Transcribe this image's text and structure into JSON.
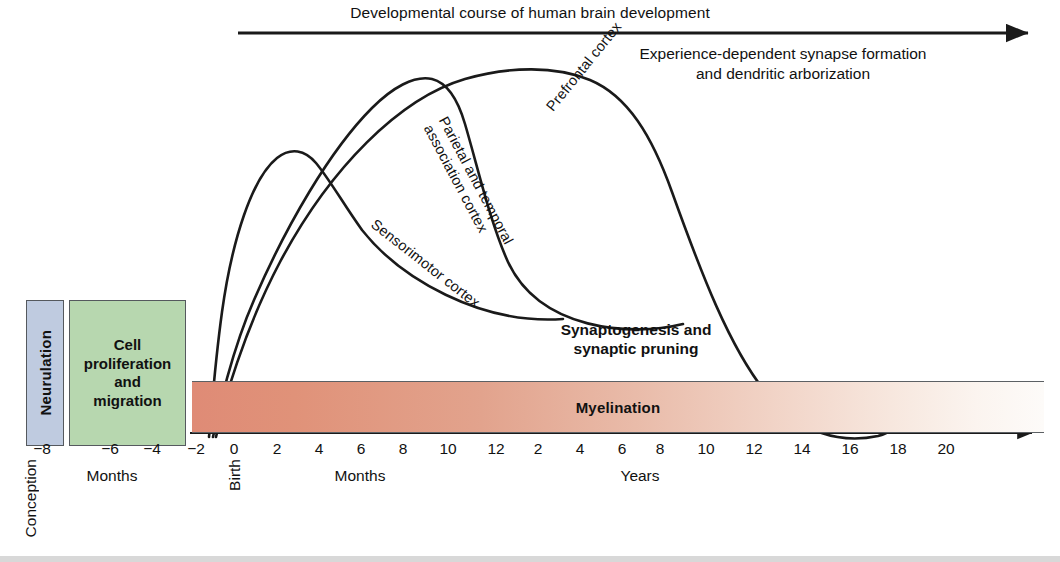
{
  "title": "Developmental course of human brain development",
  "annotations": {
    "experience_note_line1": "Experience-dependent synapse formation",
    "experience_note_line2": "and dendritic arborization",
    "synaptogenesis_line1": "Synaptogenesis and",
    "synaptogenesis_line2": "synaptic pruning",
    "myelination": "Myelination"
  },
  "phase_boxes": [
    {
      "id": "neurulation",
      "label": "Neurulation",
      "color": "#bfcbe0",
      "orientation": "vertical"
    },
    {
      "id": "cell-proliferation",
      "label": "Cell\nproliferation\nand\nmigration",
      "label_line1": "Cell",
      "label_line2": "proliferation",
      "label_line3": "and",
      "label_line4": "migration",
      "color": "#b7d7af",
      "orientation": "horizontal"
    }
  ],
  "axis": {
    "conception_label": "Conception",
    "birth_label": "Birth",
    "section1_name": "Months",
    "section2_name": "Months",
    "section3_name": "Years",
    "prenatal_ticks": [
      "−8",
      "−6",
      "−4",
      "−2"
    ],
    "infant_month_ticks": [
      "0",
      "2",
      "4",
      "6",
      "8",
      "10",
      "12"
    ],
    "year_ticks": [
      "2",
      "4",
      "6",
      "8",
      "10",
      "12",
      "14",
      "16",
      "18",
      "20"
    ]
  },
  "chart_data": {
    "type": "line",
    "title": "Developmental course of human brain development",
    "xlabel": "Age (months prenatal / months postnatal / years)",
    "ylabel": "Relative synaptic density",
    "grid": false,
    "legend": "inline-curve-labels",
    "xlim": [
      "-9 months",
      "21 years"
    ],
    "ylim": [
      0,
      1
    ],
    "series": [
      {
        "name": "Sensorimotor cortex",
        "label": "Sensorimotor cortex",
        "peak_age": "2-3 months",
        "points": [
          {
            "age": "-2 months",
            "value": 0.02
          },
          {
            "age": "-1 month",
            "value": 0.25
          },
          {
            "age": "0 months",
            "value": 0.62
          },
          {
            "age": "1 month",
            "value": 0.85
          },
          {
            "age": "2 months",
            "value": 0.93
          },
          {
            "age": "4 months",
            "value": 0.92
          },
          {
            "age": "6 months",
            "value": 0.84
          },
          {
            "age": "8 months",
            "value": 0.72
          },
          {
            "age": "10 months",
            "value": 0.6
          },
          {
            "age": "12 months",
            "value": 0.49
          },
          {
            "age": "2 years",
            "value": 0.38
          },
          {
            "age": "3 years",
            "value": 0.29
          }
        ]
      },
      {
        "name": "Parietal and temporal association cortex",
        "label": "Parietal and temporal association cortex",
        "peak_age": "8-9 months",
        "points": [
          {
            "age": "-2 months",
            "value": 0.02
          },
          {
            "age": "0 months",
            "value": 0.3
          },
          {
            "age": "2 months",
            "value": 0.56
          },
          {
            "age": "4 months",
            "value": 0.78
          },
          {
            "age": "6 months",
            "value": 0.93
          },
          {
            "age": "8 months",
            "value": 1.0
          },
          {
            "age": "10 months",
            "value": 0.99
          },
          {
            "age": "12 months",
            "value": 0.92
          },
          {
            "age": "2 years",
            "value": 0.78
          },
          {
            "age": "4 years",
            "value": 0.58
          },
          {
            "age": "6 years",
            "value": 0.4
          },
          {
            "age": "7 years",
            "value": 0.28
          }
        ]
      },
      {
        "name": "Prefrontal cortex",
        "label": "Prefrontal cortex",
        "peak_age": "2-3 years",
        "points": [
          {
            "age": "-2 months",
            "value": 0.02
          },
          {
            "age": "0 months",
            "value": 0.18
          },
          {
            "age": "4 months",
            "value": 0.45
          },
          {
            "age": "8 months",
            "value": 0.68
          },
          {
            "age": "12 months",
            "value": 0.85
          },
          {
            "age": "2 years",
            "value": 0.98
          },
          {
            "age": "3 years",
            "value": 1.0
          },
          {
            "age": "5 years",
            "value": 0.95
          },
          {
            "age": "7 years",
            "value": 0.85
          },
          {
            "age": "9 years",
            "value": 0.7
          },
          {
            "age": "11 years",
            "value": 0.52
          },
          {
            "age": "13 years",
            "value": 0.3
          },
          {
            "age": "14 years",
            "value": 0.15
          },
          {
            "age": "16 years",
            "value": 0.03
          }
        ]
      }
    ],
    "bands": [
      {
        "name": "Neurulation",
        "start": "-8 months",
        "end": "-7 months"
      },
      {
        "name": "Cell proliferation and migration",
        "start": "-7 months",
        "end": "-2 months"
      },
      {
        "name": "Myelination",
        "start": "-2 months",
        "end": "20+ years",
        "note": "intensity fades with age"
      },
      {
        "name": "Synaptogenesis and synaptic pruning",
        "start": "-2 months",
        "end": "16 years"
      },
      {
        "name": "Experience-dependent synapse formation and dendritic arborization",
        "start": "birth",
        "end": "20+ years"
      }
    ]
  }
}
